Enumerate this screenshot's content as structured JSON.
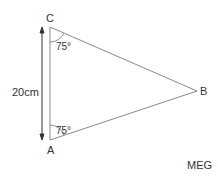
{
  "diagram": {
    "type": "triangle",
    "vertices": {
      "A": "A",
      "B": "B",
      "C": "C"
    },
    "angles": {
      "at_C": "75°",
      "at_A": "75°"
    },
    "side_AC_length": "20cm",
    "credit": "MEG"
  },
  "colors": {
    "line": "#8a8a8a",
    "text": "#333333"
  }
}
